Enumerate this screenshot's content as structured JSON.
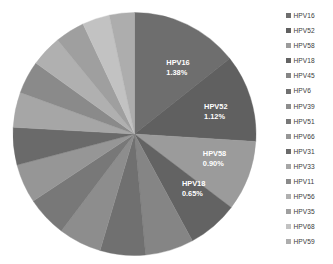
{
  "chart_data": {
    "type": "pie",
    "title": "",
    "subtitle": "",
    "xlabel": "",
    "ylabel": "",
    "grid": false,
    "legend_position": "right",
    "start_angle_deg": 0,
    "direction": "clockwise",
    "categories": [
      "HPV16",
      "HPV52",
      "HPV58",
      "HPV18",
      "HPV45",
      "HPV6",
      "HPV39",
      "HPV51",
      "HPV66",
      "HPV31",
      "HPV33",
      "HPV11",
      "HPV56",
      "HPV35",
      "HPV68",
      "HPV59"
    ],
    "values": [
      1.38,
      1.12,
      0.9,
      0.65,
      0.62,
      0.58,
      0.55,
      0.52,
      0.5,
      0.48,
      0.45,
      0.42,
      0.4,
      0.38,
      0.35,
      0.32
    ],
    "value_unit": "%",
    "slices": [
      {
        "label": "HPV16",
        "value": 1.38,
        "value_text": "1.38%",
        "color": "#6e6e6e",
        "labeled": true
      },
      {
        "label": "HPV52",
        "value": 1.12,
        "value_text": "1.12%",
        "color": "#606060",
        "labeled": true
      },
      {
        "label": "HPV58",
        "value": 0.9,
        "value_text": "0.90%",
        "color": "#9b9b9b",
        "labeled": true
      },
      {
        "label": "HPV18",
        "value": 0.65,
        "value_text": "0.65%",
        "color": "#636363",
        "labeled": true
      },
      {
        "label": "HPV45",
        "value": 0.62,
        "value_text": "",
        "color": "#858585",
        "labeled": false
      },
      {
        "label": "HPV6",
        "value": 0.58,
        "value_text": "",
        "color": "#707070",
        "labeled": false
      },
      {
        "label": "HPV39",
        "value": 0.55,
        "value_text": "",
        "color": "#8d8d8d",
        "labeled": false
      },
      {
        "label": "HPV51",
        "value": 0.52,
        "value_text": "",
        "color": "#787878",
        "labeled": false
      },
      {
        "label": "HPV66",
        "value": 0.5,
        "value_text": "",
        "color": "#969696",
        "labeled": false
      },
      {
        "label": "HPV31",
        "value": 0.48,
        "value_text": "",
        "color": "#6a6a6a",
        "labeled": false
      },
      {
        "label": "HPV33",
        "value": 0.45,
        "value_text": "",
        "color": "#a6a6a6",
        "labeled": false
      },
      {
        "label": "HPV11",
        "value": 0.42,
        "value_text": "",
        "color": "#8a8a8a",
        "labeled": false
      },
      {
        "label": "HPV56",
        "value": 0.4,
        "value_text": "",
        "color": "#b0b0b0",
        "labeled": false
      },
      {
        "label": "HPV35",
        "value": 0.38,
        "value_text": "",
        "color": "#9f9f9f",
        "labeled": false
      },
      {
        "label": "HPV68",
        "value": 0.35,
        "value_text": "",
        "color": "#c2c2c2",
        "labeled": false
      },
      {
        "label": "HPV59",
        "value": 0.32,
        "value_text": "",
        "color": "#adadad",
        "labeled": false
      }
    ]
  },
  "legend": {
    "items": [
      {
        "label": "HPV16",
        "color": "#6e6e6e"
      },
      {
        "label": "HPV52",
        "color": "#606060"
      },
      {
        "label": "HPV58",
        "color": "#9b9b9b"
      },
      {
        "label": "HPV18",
        "color": "#636363"
      },
      {
        "label": "HPV45",
        "color": "#858585"
      },
      {
        "label": "HPV6",
        "color": "#707070"
      },
      {
        "label": "HPV39",
        "color": "#8d8d8d"
      },
      {
        "label": "HPV51",
        "color": "#787878"
      },
      {
        "label": "HPV66",
        "color": "#969696"
      },
      {
        "label": "HPV31",
        "color": "#6a6a6a"
      },
      {
        "label": "HPV33",
        "color": "#a6a6a6"
      },
      {
        "label": "HPV11",
        "color": "#8a8a8a"
      },
      {
        "label": "HPV56",
        "color": "#b0b0b0"
      },
      {
        "label": "HPV35",
        "color": "#9f9f9f"
      },
      {
        "label": "HPV68",
        "color": "#c2c2c2"
      },
      {
        "label": "HPV59",
        "color": "#adadad"
      }
    ]
  }
}
